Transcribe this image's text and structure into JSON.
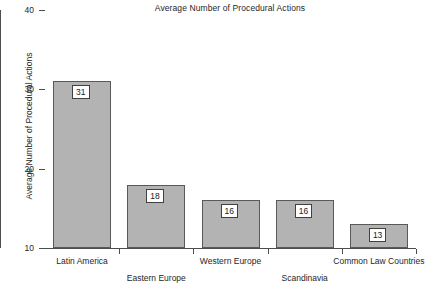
{
  "chart_data": {
    "type": "bar",
    "title": "Average Number of Procedural Actions",
    "xlabel": "",
    "ylabel": "Average Number of Procedural Actions",
    "categories": [
      "Latin America",
      "Eastern Europe",
      "Western Europe",
      "Scandinavia",
      "Common Law Countries"
    ],
    "values": [
      31,
      18,
      16,
      16,
      13
    ],
    "value_labels": [
      "31",
      "18",
      "16",
      "16",
      "13"
    ],
    "ylim": [
      10,
      40
    ],
    "yticks": [
      10,
      20,
      30,
      40
    ],
    "ytick_labels": [
      "10",
      "20",
      "30",
      "40"
    ],
    "grid": false,
    "legend": null,
    "bar_color": "#b3b3b3",
    "bar_edge_color": "#595959",
    "axis_color": "#4d4d4d",
    "label_rows": [
      {
        "label": "Latin America",
        "row": 0
      },
      {
        "label": "Eastern Europe",
        "row": 1
      },
      {
        "label": "Western Europe",
        "row": 0
      },
      {
        "label": "Scandinavia",
        "row": 1
      },
      {
        "label": "Common Law Countries",
        "row": 0
      }
    ]
  }
}
